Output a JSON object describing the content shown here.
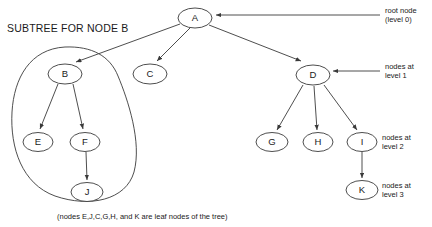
{
  "diagram": {
    "title": "SUBTREE FOR NODE B",
    "caption": "(nodes E,J,C,G,H, and K are leaf nodes of the tree)",
    "stroke_color": "#3a3a3a",
    "background_color": "#ffffff",
    "nodes": [
      {
        "id": "A",
        "label": "A",
        "cx": 195,
        "cy": 18,
        "rx": 17,
        "ry": 10,
        "level": 0
      },
      {
        "id": "B",
        "label": "B",
        "cx": 65,
        "cy": 74,
        "rx": 17,
        "ry": 10,
        "level": 1
      },
      {
        "id": "C",
        "label": "C",
        "cx": 150,
        "cy": 74,
        "rx": 17,
        "ry": 10,
        "level": 1
      },
      {
        "id": "D",
        "label": "D",
        "cx": 313,
        "cy": 75,
        "rx": 17,
        "ry": 10,
        "level": 1
      },
      {
        "id": "E",
        "label": "E",
        "cx": 38,
        "cy": 142,
        "rx": 15,
        "ry": 9.5,
        "level": 2
      },
      {
        "id": "F",
        "label": "F",
        "cx": 85,
        "cy": 142,
        "rx": 15,
        "ry": 9.5,
        "level": 2
      },
      {
        "id": "G",
        "label": "G",
        "cx": 272,
        "cy": 142,
        "rx": 16,
        "ry": 9.5,
        "level": 2
      },
      {
        "id": "H",
        "label": "H",
        "cx": 318,
        "cy": 142,
        "rx": 15,
        "ry": 9.5,
        "level": 2
      },
      {
        "id": "I",
        "label": "I",
        "cx": 362,
        "cy": 142,
        "rx": 15,
        "ry": 9.5,
        "level": 2
      },
      {
        "id": "J",
        "label": "J",
        "cx": 87,
        "cy": 192,
        "rx": 16,
        "ry": 9.5,
        "level": 3
      },
      {
        "id": "K",
        "label": "K",
        "cx": 362,
        "cy": 190,
        "rx": 16,
        "ry": 9.5,
        "level": 3
      }
    ],
    "edges": [
      {
        "from": "A",
        "to": "B"
      },
      {
        "from": "A",
        "to": "C"
      },
      {
        "from": "A",
        "to": "D"
      },
      {
        "from": "B",
        "to": "E"
      },
      {
        "from": "B",
        "to": "F"
      },
      {
        "from": "F",
        "to": "J"
      },
      {
        "from": "D",
        "to": "G"
      },
      {
        "from": "D",
        "to": "H"
      },
      {
        "from": "D",
        "to": "I"
      },
      {
        "from": "I",
        "to": "K"
      }
    ],
    "annotations": [
      {
        "id": "root-node",
        "line1": "root node",
        "line2": "(level 0)",
        "x": 385,
        "y": 8,
        "arrow_from_x": 380,
        "arrow_from_y": 15,
        "arrow_to_x": 216,
        "arrow_to_y": 15
      },
      {
        "id": "level-1",
        "line1": "nodes at",
        "line2": "level 1",
        "x": 385,
        "y": 63,
        "arrow_from_x": 380,
        "arrow_from_y": 71,
        "arrow_to_x": 333,
        "arrow_to_y": 71
      },
      {
        "id": "level-2",
        "line1": "nodes at",
        "line2": "level 2",
        "x": 382,
        "y": 134,
        "arrow_from_x": null,
        "arrow_from_y": null,
        "arrow_to_x": null,
        "arrow_to_y": null
      },
      {
        "id": "level-3",
        "line1": "nodes at",
        "line2": "level 3",
        "x": 382,
        "y": 182,
        "arrow_from_x": null,
        "arrow_from_y": null,
        "arrow_to_x": null,
        "arrow_to_y": null
      }
    ],
    "subtree_outline_label": "subtree-for-node-b-outline"
  }
}
